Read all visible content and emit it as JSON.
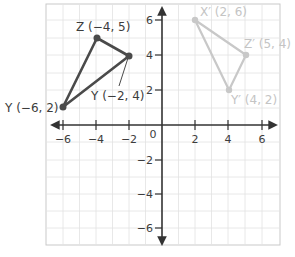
{
  "grid": {
    "x_range": [
      -7,
      7
    ],
    "y_range": [
      -7,
      7
    ],
    "x_ticks": [
      -6,
      -4,
      -2,
      2,
      4,
      6
    ],
    "y_ticks": [
      6,
      4,
      2,
      -2,
      -4,
      -6
    ],
    "origin_label": "0"
  },
  "labels": {
    "x_tick_m6": "−6",
    "x_tick_m4": "−4",
    "x_tick_m2": "−2",
    "x_tick_2": "2",
    "x_tick_4": "4",
    "x_tick_6": "6",
    "y_tick_6": "6",
    "y_tick_4": "4",
    "y_tick_2": "2",
    "y_tick_m2": "−2",
    "y_tick_m4": "−4",
    "y_tick_m6": "−6",
    "origin": "0"
  },
  "original_triangle": {
    "color": "#4a4a4a",
    "vertices": [
      {
        "name": "Z",
        "x": -4,
        "y": 5,
        "label": "Z (−4, 5)"
      },
      {
        "name": "Y",
        "x": -2,
        "y": 4,
        "label": "Y (−2, 4)"
      },
      {
        "name": "Y",
        "x": -6,
        "y": 2,
        "label": "Y (−6, 2)"
      }
    ]
  },
  "image_triangle": {
    "color": "#c8c8c8",
    "vertices": [
      {
        "name": "X'",
        "x": 2,
        "y": 6,
        "label": "X′ (2, 6)"
      },
      {
        "name": "Z'",
        "x": 5,
        "y": 4,
        "label": "Z′ (5, 4)"
      },
      {
        "name": "Y'",
        "x": 4,
        "y": 2,
        "label": "Y′ (4, 2)"
      }
    ]
  }
}
